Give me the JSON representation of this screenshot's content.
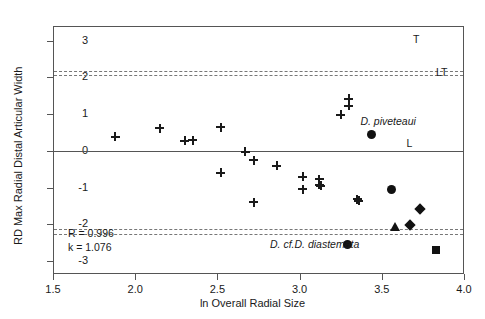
{
  "chart_data": {
    "type": "scatter",
    "title": "",
    "xlabel": "ln Overall Radial Size",
    "ylabel": "RD Max Radial Distal Articular Width",
    "xlim": [
      1.5,
      4.0
    ],
    "ylim": [
      -3.35,
      3.4
    ],
    "xticks": [
      1.5,
      2.0,
      2.5,
      3.0,
      3.5,
      4.0
    ],
    "xticklabels": [
      "1.5",
      "2.0",
      "2.5",
      "3.0",
      "3.5",
      "4.0"
    ],
    "yticks": [
      3,
      2,
      1,
      0,
      -1,
      -2,
      -3
    ],
    "yticklabels": [
      "3",
      "2",
      "1",
      "0",
      "-1",
      "-2",
      "-3"
    ],
    "grid": false,
    "legend": null,
    "series": [
      {
        "name": "comparative sample",
        "marker": "plus",
        "points": [
          {
            "x": 1.88,
            "y": 0.38
          },
          {
            "x": 2.15,
            "y": 0.62
          },
          {
            "x": 2.3,
            "y": 0.27
          },
          {
            "x": 2.35,
            "y": 0.29
          },
          {
            "x": 2.52,
            "y": 0.65
          },
          {
            "x": 2.52,
            "y": -0.6
          },
          {
            "x": 2.67,
            "y": -0.02
          },
          {
            "x": 2.72,
            "y": -0.26
          },
          {
            "x": 2.72,
            "y": -1.4
          },
          {
            "x": 2.86,
            "y": -0.41
          },
          {
            "x": 3.02,
            "y": -1.04
          },
          {
            "x": 3.02,
            "y": -0.7
          },
          {
            "x": 3.12,
            "y": -0.77
          },
          {
            "x": 3.12,
            "y": -0.92
          },
          {
            "x": 3.13,
            "y": -0.95
          },
          {
            "x": 3.3,
            "y": 1.42
          },
          {
            "x": 3.3,
            "y": 1.23
          },
          {
            "x": 3.25,
            "y": 0.98
          },
          {
            "x": 3.35,
            "y": -1.31
          },
          {
            "x": 3.36,
            "y": -1.35
          }
        ]
      },
      {
        "name": "circle taxa",
        "marker": "circle",
        "points": [
          {
            "x": 3.44,
            "y": 0.46
          },
          {
            "x": 3.56,
            "y": -1.06
          },
          {
            "x": 3.29,
            "y": -2.55
          }
        ]
      },
      {
        "name": "diamond taxa",
        "marker": "diamond",
        "points": [
          {
            "x": 3.73,
            "y": -1.58
          },
          {
            "x": 3.67,
            "y": -2.02
          }
        ]
      },
      {
        "name": "triangle taxon",
        "marker": "triangle",
        "points": [
          {
            "x": 3.58,
            "y": -2.08
          }
        ]
      },
      {
        "name": "square taxon",
        "marker": "square",
        "points": [
          {
            "x": 3.83,
            "y": -2.7
          }
        ]
      }
    ],
    "reference_bands": [
      {
        "name": "upper-confidence-band",
        "y_top": 2.18,
        "y_bottom": 2.06,
        "style": "dashed",
        "label": "LT"
      },
      {
        "name": "lower-confidence-band",
        "y_top": -2.12,
        "y_bottom": -2.26,
        "style": "dashed",
        "label": ""
      }
    ],
    "zero_line": 0,
    "annotations": [
      {
        "name": "annot-T",
        "text": "T",
        "x": 3.69,
        "y": 3.02,
        "italic": false
      },
      {
        "name": "annot-LT",
        "text": "LT",
        "x": 3.83,
        "y": 2.12,
        "italic": false
      },
      {
        "name": "annot-L",
        "text": "L",
        "x": 3.65,
        "y": 0.19,
        "italic": false
      },
      {
        "name": "annot-piveteaui",
        "text": "D. piveteaui",
        "x": 3.37,
        "y": 0.79,
        "italic": true
      },
      {
        "name": "annot-diastemata",
        "text": "D. cf.D. diastemata",
        "x": 2.82,
        "y": -2.55,
        "italic": true
      }
    ],
    "stats": {
      "r_label": "R = 0.996",
      "k_label": "k = 1.076"
    }
  }
}
